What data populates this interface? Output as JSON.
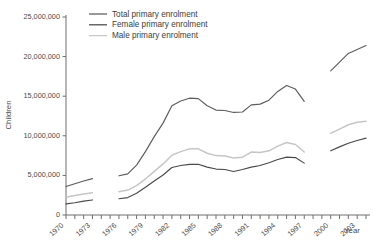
{
  "chart_data": {
    "type": "line",
    "title": "",
    "xlabel": "Year",
    "ylabel": "Children",
    "ylim": [
      0,
      25000000
    ],
    "xlim": [
      1970,
      2004
    ],
    "grid": false,
    "legend_position": "top-left",
    "ytick_labels": [
      "0",
      "5,000,000",
      "10,000,000",
      "15,000,000",
      "20,000,000",
      "25,000,000"
    ],
    "ytick_values": [
      0,
      5000000,
      10000000,
      15000000,
      20000000,
      25000000
    ],
    "xtick_labels": [
      "1970",
      "1973",
      "1976",
      "1979",
      "1982",
      "1985",
      "1988",
      "1991",
      "1994",
      "1997",
      "2000",
      "2003"
    ],
    "xtick_values": [
      1970,
      1973,
      1976,
      1979,
      1982,
      1985,
      1988,
      1991,
      1994,
      1997,
      2000,
      2003
    ],
    "x_minor_ticks": [
      1970,
      1971,
      1972,
      1973,
      1974,
      1975,
      1976,
      1977,
      1978,
      1979,
      1980,
      1981,
      1982,
      1983,
      1984,
      1985,
      1986,
      1987,
      1988,
      1989,
      1990,
      1991,
      1992,
      1993,
      1994,
      1995,
      1996,
      1997,
      1998,
      1999,
      2000,
      2001,
      2002,
      2003,
      2004
    ],
    "series": [
      {
        "name": "Total primary enrolment",
        "color": "#5c5c5c",
        "segments": [
          {
            "x": [
              1970,
              1971,
              1972,
              1973
            ],
            "values": [
              3600000,
              3950000,
              4300000,
              4600000
            ]
          },
          {
            "x": [
              1976,
              1977,
              1978,
              1979,
              1980,
              1981,
              1982,
              1983,
              1984,
              1985,
              1986,
              1987,
              1988,
              1989,
              1990,
              1991,
              1992,
              1993,
              1994,
              1995,
              1996,
              1997
            ],
            "values": [
              4950000,
              5200000,
              6300000,
              8000000,
              9900000,
              11600000,
              13800000,
              14400000,
              14750000,
              14700000,
              13800000,
              13250000,
              13200000,
              12950000,
              13000000,
              13900000,
              14000000,
              14500000,
              15600000,
              16350000,
              15900000,
              14350000
            ]
          },
          {
            "x": [
              2000,
              2001,
              2002,
              2003,
              2004
            ],
            "values": [
              18200000,
              19300000,
              20400000,
              20900000,
              21400000
            ]
          }
        ]
      },
      {
        "name": "Female primary enrolment",
        "color": "#4a4a4a",
        "segments": [
          {
            "x": [
              1970,
              1971,
              1972,
              1973
            ],
            "values": [
              1400000,
              1550000,
              1750000,
              1900000
            ]
          },
          {
            "x": [
              1976,
              1977,
              1978,
              1979,
              1980,
              1981,
              1982,
              1983,
              1984,
              1985,
              1986,
              1987,
              1988,
              1989,
              1990,
              1991,
              1992,
              1993,
              1994,
              1995,
              1996,
              1997
            ],
            "values": [
              2050000,
              2200000,
              2750000,
              3500000,
              4300000,
              5050000,
              6000000,
              6250000,
              6400000,
              6400000,
              6050000,
              5800000,
              5750000,
              5500000,
              5750000,
              6050000,
              6250000,
              6600000,
              7000000,
              7300000,
              7250000,
              6550000
            ]
          },
          {
            "x": [
              2000,
              2001,
              2002,
              2003,
              2004
            ],
            "values": [
              8100000,
              8600000,
              9050000,
              9400000,
              9700000
            ]
          }
        ]
      },
      {
        "name": "Male primary enrolment",
        "color": "#c6c6c6",
        "segments": [
          {
            "x": [
              1970,
              1971,
              1972,
              1973
            ],
            "values": [
              2250000,
              2450000,
              2650000,
              2800000
            ]
          },
          {
            "x": [
              1976,
              1977,
              1978,
              1979,
              1980,
              1981,
              1982,
              1983,
              1984,
              1985,
              1986,
              1987,
              1988,
              1989,
              1990,
              1991,
              1992,
              1993,
              1994,
              1995,
              1996,
              1997
            ],
            "values": [
              2950000,
              3150000,
              3700000,
              4550000,
              5500000,
              6450000,
              7550000,
              8000000,
              8350000,
              8350000,
              7800000,
              7500000,
              7450000,
              7200000,
              7300000,
              7950000,
              7900000,
              8100000,
              8700000,
              9150000,
              8900000,
              7950000
            ]
          },
          {
            "x": [
              2000,
              2001,
              2002,
              2003,
              2004
            ],
            "values": [
              10300000,
              10850000,
              11400000,
              11700000,
              11850000
            ]
          }
        ]
      }
    ]
  },
  "legend": {
    "items": [
      {
        "label": "Total primary enrolment"
      },
      {
        "label": "Female primary enrolment"
      },
      {
        "label": "Male primary enrolment"
      }
    ]
  }
}
